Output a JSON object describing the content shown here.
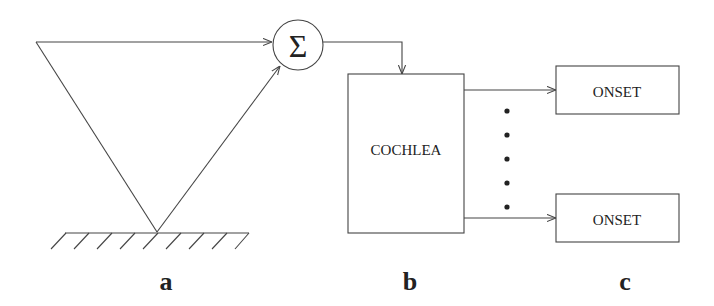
{
  "diagram": {
    "sum_symbol": "Σ",
    "cochlea_label": "COCHLEA",
    "onset_labels": [
      "ONSET",
      "ONSET"
    ],
    "panel_labels": [
      "a",
      "b",
      "c"
    ],
    "colors": {
      "stroke": "#444444",
      "text": "#222222",
      "background": "#ffffff"
    }
  }
}
